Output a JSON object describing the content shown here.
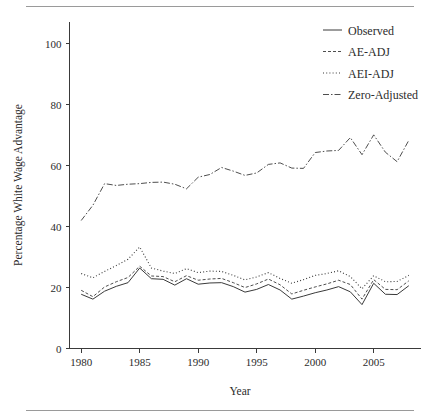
{
  "figure": {
    "background_color": "#ffffff",
    "ink_color": "#2b2b2b",
    "rule_color": "#9a9a9a"
  },
  "axes": {
    "x_title": "Year",
    "y_title": "Percentage White Wage Advantage",
    "x_ticks": [
      "1980",
      "1985",
      "1990",
      "1995",
      "2000",
      "2005"
    ],
    "y_ticks": [
      "0",
      "20",
      "40",
      "60",
      "80",
      "100"
    ]
  },
  "legend": {
    "items": [
      {
        "label": "Observed",
        "style": "solid"
      },
      {
        "label": "AE-ADJ",
        "style": "fine-dash"
      },
      {
        "label": "AEI-ADJ",
        "style": "dotted"
      },
      {
        "label": "Zero-Adjusted",
        "style": "dash-dot"
      }
    ]
  },
  "chart_data": {
    "type": "line",
    "title": "",
    "xlabel": "Year",
    "ylabel": "Percentage White Wage Advantage",
    "xlim": [
      1979,
      2009
    ],
    "ylim": [
      0,
      105
    ],
    "xticks": [
      1980,
      1985,
      1990,
      1995,
      2000,
      2005
    ],
    "yticks": [
      0,
      20,
      40,
      60,
      80,
      100
    ],
    "grid": false,
    "legend_position": "top-right",
    "x": [
      1980,
      1981,
      1982,
      1983,
      1984,
      1985,
      1986,
      1987,
      1988,
      1989,
      1990,
      1991,
      1992,
      1993,
      1994,
      1995,
      1996,
      1997,
      1998,
      1999,
      2000,
      2001,
      2002,
      2003,
      2004,
      2005,
      2006,
      2007,
      2008
    ],
    "series": [
      {
        "name": "Observed",
        "style": "solid",
        "values": [
          17.8,
          16.2,
          18.8,
          20.4,
          21.6,
          26.4,
          22.9,
          22.7,
          20.8,
          22.9,
          21.1,
          21.5,
          21.6,
          20.3,
          18.5,
          19.4,
          21.0,
          19.2,
          16.2,
          17.2,
          18.3,
          19.2,
          20.3,
          18.6,
          14.4,
          21.4,
          17.8,
          17.7,
          20.6
        ]
      },
      {
        "name": "AE-ADJ",
        "style": "fine-dash",
        "values": [
          19.1,
          17.0,
          20.2,
          21.9,
          23.3,
          27.0,
          23.8,
          23.6,
          21.9,
          23.9,
          22.4,
          22.8,
          23.0,
          21.6,
          20.0,
          21.2,
          22.8,
          20.9,
          17.9,
          19.1,
          20.2,
          21.2,
          22.4,
          21.0,
          16.2,
          22.6,
          19.4,
          19.3,
          22.2
        ]
      },
      {
        "name": "AEI-ADJ",
        "style": "dotted",
        "values": [
          24.6,
          23.2,
          25.3,
          27.2,
          29.3,
          33.3,
          26.4,
          25.4,
          24.6,
          26.2,
          24.9,
          25.4,
          25.3,
          24.0,
          22.5,
          23.5,
          24.9,
          23.0,
          21.4,
          22.6,
          24.0,
          24.6,
          25.5,
          23.6,
          19.6,
          23.9,
          21.9,
          22.0,
          24.0
        ]
      },
      {
        "name": "Zero-Adjusted",
        "style": "dash-dot",
        "values": [
          42.0,
          47.0,
          54.1,
          53.5,
          53.9,
          54.1,
          54.5,
          54.6,
          53.9,
          52.4,
          56.2,
          57.1,
          59.4,
          58.2,
          56.8,
          57.6,
          60.4,
          60.9,
          59.2,
          59.1,
          64.3,
          64.8,
          65.0,
          69.2,
          63.6,
          70.1,
          64.4,
          61.3,
          68.3
        ]
      }
    ]
  }
}
